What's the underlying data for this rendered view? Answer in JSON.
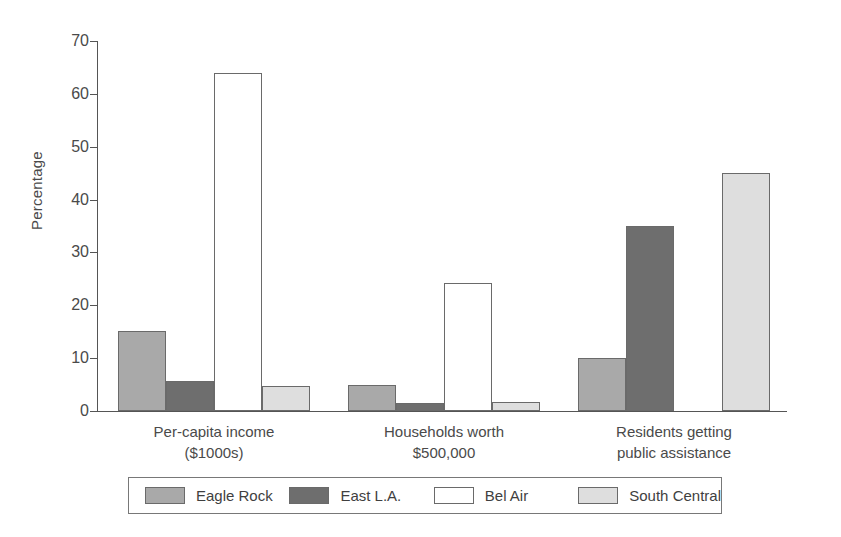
{
  "chart_data": {
    "type": "bar",
    "title": "",
    "xlabel": "",
    "ylabel": "Percentage",
    "ylim": [
      0,
      70
    ],
    "yticks": [
      0,
      10,
      20,
      30,
      40,
      50,
      60,
      70
    ],
    "ytick_labels": [
      "0",
      "10",
      "20",
      "30",
      "40",
      "50",
      "60",
      "70"
    ],
    "grid": false,
    "legend_position": "bottom",
    "categories": [
      "Per-capita income\n($1000s)",
      "Households worth\n$500,000",
      "Residents getting\npublic assistance"
    ],
    "series": [
      {
        "name": "Eagle Rock",
        "color": "#a9a9a9",
        "values": [
          15.1,
          5.0,
          10.1
        ]
      },
      {
        "name": "East L.A.",
        "color": "#6e6e6e",
        "values": [
          5.6,
          1.5,
          35.0
        ]
      },
      {
        "name": "Bel Air",
        "color": "#ffffff",
        "values": [
          64.0,
          24.3,
          0
        ]
      },
      {
        "name": "South Central",
        "color": "#dedede",
        "values": [
          4.8,
          1.7,
          45.0
        ]
      }
    ]
  },
  "axes": {
    "y_label": "Percentage"
  },
  "colors": {
    "axis": "#555555",
    "bar_outline": "#6a6a6a",
    "text": "#4a4a4a",
    "background": "#ffffff"
  }
}
